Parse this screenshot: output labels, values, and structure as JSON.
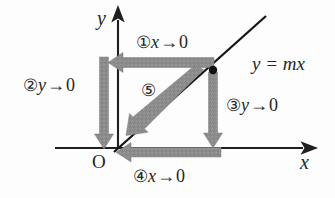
{
  "figure": {
    "kind": "coordinate-plane-limit-diagram",
    "background_color": "#fdfdfd",
    "axis_color": "#1f1f1f",
    "line_color": "#151515",
    "arrow_color": "#8c8c8c",
    "text_color": "#262626"
  },
  "axes": {
    "x_label": "x",
    "y_label": "y",
    "origin_label": "O"
  },
  "line": {
    "equation_label": "y = mx",
    "equation_parts": {
      "y": "y",
      "equals": "=",
      "m": "m",
      "x": "x"
    }
  },
  "point": {
    "name": "point-on-line",
    "marker": "filled-dot"
  },
  "steps": [
    {
      "id": "step-1",
      "marker": "①",
      "variable": "x",
      "arrow": "→",
      "limit": "0",
      "text": "①x → 0",
      "direction": "left",
      "description": "horizontal arrow from point leftward toward y-axis"
    },
    {
      "id": "step-2",
      "marker": "②",
      "variable": "y",
      "arrow": "→",
      "limit": "0",
      "text": "②y → 0",
      "direction": "down",
      "description": "vertical arrow down along the y-axis toward origin"
    },
    {
      "id": "step-3",
      "marker": "③",
      "variable": "y",
      "arrow": "→",
      "limit": "0",
      "text": "③y → 0",
      "direction": "down",
      "description": "vertical arrow from point downward to the x-axis"
    },
    {
      "id": "step-4",
      "marker": "④",
      "variable": "x",
      "arrow": "→",
      "limit": "0",
      "text": "④x → 0",
      "direction": "left",
      "description": "horizontal arrow along the x-axis leftward toward origin"
    },
    {
      "id": "step-5",
      "marker": "⑤",
      "variable": "",
      "arrow": "",
      "limit": "",
      "text": "⑤",
      "direction": "down-left-diagonal",
      "description": "diagonal arrow along the line toward the origin"
    }
  ]
}
